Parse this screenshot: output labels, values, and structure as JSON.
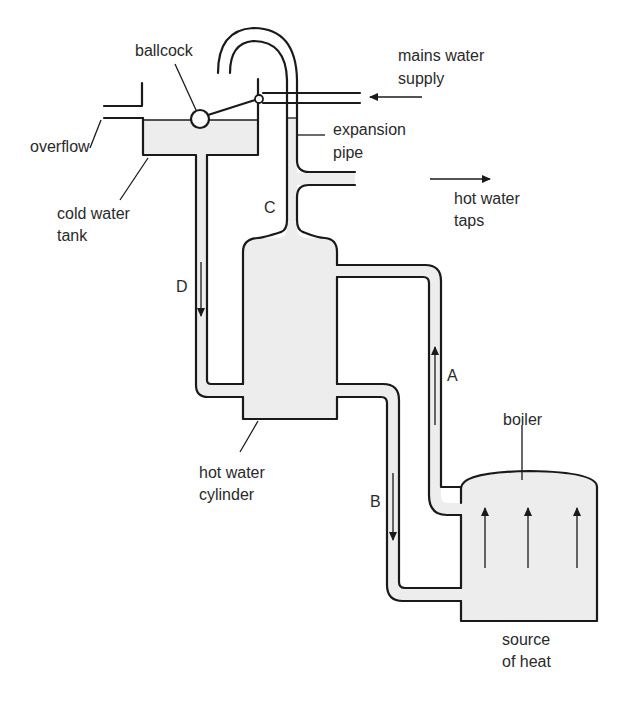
{
  "diagram": {
    "labels": {
      "ballcock": "ballcock",
      "mains_line1": "mains water",
      "mains_line2": "supply",
      "overflow": "overflow",
      "expansion_line1": "expansion",
      "expansion_line2": "pipe",
      "cold_tank_line1": "cold water",
      "cold_tank_line2": "tank",
      "hot_taps_line1": "hot water",
      "hot_taps_line2": "taps",
      "pipe_c": "C",
      "pipe_d": "D",
      "pipe_a": "A",
      "pipe_b": "B",
      "cylinder_line1": "hot water",
      "cylinder_line2": "cylinder",
      "boiler": "boiler",
      "heat_line1": "source",
      "heat_line2": "of heat"
    },
    "flow_directions": {
      "mains": "into system (leftward)",
      "hot_taps": "out to taps (rightward)",
      "A": "up",
      "B": "down",
      "D": "down",
      "boiler_heat": "up"
    },
    "colors": {
      "line": "#1a1a1a",
      "water_fill": "#ededed",
      "background": "#ffffff"
    }
  }
}
